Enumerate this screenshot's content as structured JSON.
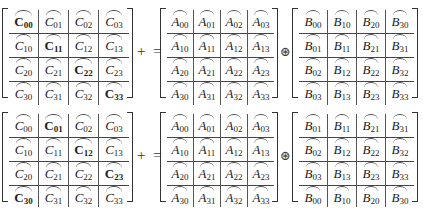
{
  "diagram": {
    "operators": {
      "plus_equals": "+ =",
      "elementwise": "⊛"
    },
    "equations": [
      {
        "C": {
          "name": "C",
          "rows": [
            [
              {
                "s": "C",
                "i": "00",
                "bold": true
              },
              {
                "s": "C",
                "i": "01",
                "bold": false
              },
              {
                "s": "C",
                "i": "02",
                "bold": false
              },
              {
                "s": "C",
                "i": "03",
                "bold": false
              }
            ],
            [
              {
                "s": "C",
                "i": "10",
                "bold": false
              },
              {
                "s": "C",
                "i": "11",
                "bold": true
              },
              {
                "s": "C",
                "i": "12",
                "bold": false
              },
              {
                "s": "C",
                "i": "13",
                "bold": false
              }
            ],
            [
              {
                "s": "C",
                "i": "20",
                "bold": false
              },
              {
                "s": "C",
                "i": "21",
                "bold": false
              },
              {
                "s": "C",
                "i": "22",
                "bold": true
              },
              {
                "s": "C",
                "i": "23",
                "bold": false
              }
            ],
            [
              {
                "s": "C",
                "i": "30",
                "bold": false
              },
              {
                "s": "C",
                "i": "31",
                "bold": false
              },
              {
                "s": "C",
                "i": "32",
                "bold": false
              },
              {
                "s": "C",
                "i": "33",
                "bold": true
              }
            ]
          ]
        },
        "A": {
          "name": "A",
          "rows": [
            [
              {
                "s": "A",
                "i": "00"
              },
              {
                "s": "A",
                "i": "01"
              },
              {
                "s": "A",
                "i": "02"
              },
              {
                "s": "A",
                "i": "03"
              }
            ],
            [
              {
                "s": "A",
                "i": "10"
              },
              {
                "s": "A",
                "i": "11"
              },
              {
                "s": "A",
                "i": "12"
              },
              {
                "s": "A",
                "i": "13"
              }
            ],
            [
              {
                "s": "A",
                "i": "20"
              },
              {
                "s": "A",
                "i": "21"
              },
              {
                "s": "A",
                "i": "22"
              },
              {
                "s": "A",
                "i": "23"
              }
            ],
            [
              {
                "s": "A",
                "i": "30"
              },
              {
                "s": "A",
                "i": "31"
              },
              {
                "s": "A",
                "i": "32"
              },
              {
                "s": "A",
                "i": "33"
              }
            ]
          ]
        },
        "B": {
          "name": "B",
          "rows": [
            [
              {
                "s": "B",
                "i": "00"
              },
              {
                "s": "B",
                "i": "10"
              },
              {
                "s": "B",
                "i": "20"
              },
              {
                "s": "B",
                "i": "30"
              }
            ],
            [
              {
                "s": "B",
                "i": "01"
              },
              {
                "s": "B",
                "i": "11"
              },
              {
                "s": "B",
                "i": "21"
              },
              {
                "s": "B",
                "i": "31"
              }
            ],
            [
              {
                "s": "B",
                "i": "02"
              },
              {
                "s": "B",
                "i": "12"
              },
              {
                "s": "B",
                "i": "22"
              },
              {
                "s": "B",
                "i": "32"
              }
            ],
            [
              {
                "s": "B",
                "i": "03"
              },
              {
                "s": "B",
                "i": "13"
              },
              {
                "s": "B",
                "i": "23"
              },
              {
                "s": "B",
                "i": "33"
              }
            ]
          ]
        }
      },
      {
        "C": {
          "name": "C",
          "rows": [
            [
              {
                "s": "C",
                "i": "00",
                "bold": false
              },
              {
                "s": "C",
                "i": "01",
                "bold": true
              },
              {
                "s": "C",
                "i": "02",
                "bold": false
              },
              {
                "s": "C",
                "i": "03",
                "bold": false
              }
            ],
            [
              {
                "s": "C",
                "i": "10",
                "bold": false
              },
              {
                "s": "C",
                "i": "11",
                "bold": false
              },
              {
                "s": "C",
                "i": "12",
                "bold": true
              },
              {
                "s": "C",
                "i": "13",
                "bold": false
              }
            ],
            [
              {
                "s": "C",
                "i": "20",
                "bold": false
              },
              {
                "s": "C",
                "i": "21",
                "bold": false
              },
              {
                "s": "C",
                "i": "22",
                "bold": false
              },
              {
                "s": "C",
                "i": "23",
                "bold": true
              }
            ],
            [
              {
                "s": "C",
                "i": "30",
                "bold": true
              },
              {
                "s": "C",
                "i": "31",
                "bold": false
              },
              {
                "s": "C",
                "i": "32",
                "bold": false
              },
              {
                "s": "C",
                "i": "33",
                "bold": false
              }
            ]
          ]
        },
        "A": {
          "name": "A",
          "rows": [
            [
              {
                "s": "A",
                "i": "00"
              },
              {
                "s": "A",
                "i": "01"
              },
              {
                "s": "A",
                "i": "02"
              },
              {
                "s": "A",
                "i": "03"
              }
            ],
            [
              {
                "s": "A",
                "i": "10"
              },
              {
                "s": "A",
                "i": "11"
              },
              {
                "s": "A",
                "i": "12"
              },
              {
                "s": "A",
                "i": "13"
              }
            ],
            [
              {
                "s": "A",
                "i": "20"
              },
              {
                "s": "A",
                "i": "21"
              },
              {
                "s": "A",
                "i": "22"
              },
              {
                "s": "A",
                "i": "23"
              }
            ],
            [
              {
                "s": "A",
                "i": "30"
              },
              {
                "s": "A",
                "i": "31"
              },
              {
                "s": "A",
                "i": "32"
              },
              {
                "s": "A",
                "i": "33"
              }
            ]
          ]
        },
        "B": {
          "name": "B",
          "rows": [
            [
              {
                "s": "B",
                "i": "01"
              },
              {
                "s": "B",
                "i": "11"
              },
              {
                "s": "B",
                "i": "21"
              },
              {
                "s": "B",
                "i": "31"
              }
            ],
            [
              {
                "s": "B",
                "i": "02"
              },
              {
                "s": "B",
                "i": "12"
              },
              {
                "s": "B",
                "i": "22"
              },
              {
                "s": "B",
                "i": "32"
              }
            ],
            [
              {
                "s": "B",
                "i": "03"
              },
              {
                "s": "B",
                "i": "13"
              },
              {
                "s": "B",
                "i": "23"
              },
              {
                "s": "B",
                "i": "33"
              }
            ],
            [
              {
                "s": "B",
                "i": "00"
              },
              {
                "s": "B",
                "i": "10"
              },
              {
                "s": "B",
                "i": "20"
              },
              {
                "s": "B",
                "i": "30"
              }
            ]
          ]
        }
      }
    ]
  }
}
